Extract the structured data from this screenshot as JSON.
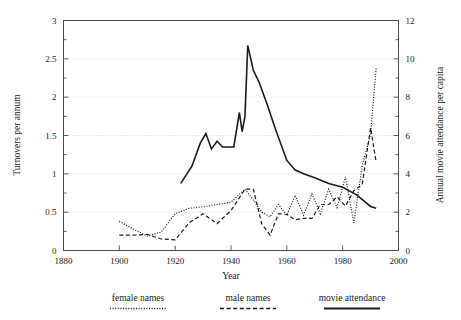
{
  "chart_data": {
    "type": "line",
    "title": "",
    "xlabel": "Year",
    "ylabel": "Turnovers per annum",
    "y2label": "Annual movie attendance per capita",
    "xlim": [
      1880,
      2000
    ],
    "ylim": [
      0,
      3
    ],
    "y2lim": [
      0,
      12
    ],
    "grid": true,
    "legend_position": "below",
    "x_ticks": [
      "1880",
      "1900",
      "1920",
      "1940",
      "1960",
      "1980",
      "2000"
    ],
    "x_tick_values": [
      1880,
      1900,
      1920,
      1940,
      1960,
      1980,
      2000
    ],
    "y_ticks": [
      "0",
      "0.5",
      "1",
      "1.5",
      "2",
      "2.5",
      "3"
    ],
    "y_tick_values": [
      0,
      0.5,
      1,
      1.5,
      2,
      2.5,
      3
    ],
    "y2_ticks": [
      "0",
      "2",
      "4",
      "6",
      "8",
      "10",
      "12"
    ],
    "y2_tick_values": [
      0,
      2,
      4,
      6,
      8,
      10,
      12
    ],
    "series": [
      {
        "name": "female names",
        "style": "dotted",
        "axis": "left",
        "color": "#1a1a1a",
        "x": [
          1900,
          1905,
          1910,
          1915,
          1920,
          1925,
          1930,
          1935,
          1940,
          1945,
          1948,
          1951,
          1954,
          1957,
          1960,
          1963,
          1966,
          1969,
          1972,
          1975,
          1978,
          1981,
          1984,
          1987,
          1990,
          1992
        ],
        "y": [
          0.38,
          0.28,
          0.19,
          0.24,
          0.48,
          0.55,
          0.57,
          0.6,
          0.63,
          0.8,
          0.66,
          0.5,
          0.44,
          0.6,
          0.46,
          0.72,
          0.46,
          0.74,
          0.48,
          0.8,
          0.56,
          0.96,
          0.36,
          1.1,
          1.52,
          2.38
        ]
      },
      {
        "name": "male names",
        "style": "dashed",
        "axis": "left",
        "color": "#1a1a1a",
        "x": [
          1900,
          1905,
          1910,
          1915,
          1920,
          1925,
          1930,
          1935,
          1940,
          1945,
          1948,
          1951,
          1954,
          1957,
          1960,
          1963,
          1966,
          1969,
          1972,
          1975,
          1978,
          1981,
          1984,
          1987,
          1990,
          1992
        ],
        "y": [
          0.2,
          0.2,
          0.21,
          0.15,
          0.14,
          0.36,
          0.48,
          0.35,
          0.52,
          0.8,
          0.8,
          0.35,
          0.2,
          0.48,
          0.47,
          0.4,
          0.42,
          0.42,
          0.6,
          0.6,
          0.7,
          0.58,
          0.78,
          0.86,
          1.6,
          1.15
        ]
      },
      {
        "name": "movie attendance",
        "style": "solid",
        "axis": "right",
        "color": "#1a1a1a",
        "x": [
          1922,
          1926,
          1929,
          1931,
          1933,
          1935,
          1937,
          1939,
          1941,
          1943,
          1944,
          1945,
          1946,
          1948,
          1950,
          1953,
          1956,
          1960,
          1963,
          1966,
          1970,
          1975,
          1980,
          1985,
          1990,
          1992
        ],
        "y_right": [
          3.5,
          4.4,
          5.6,
          6.1,
          5.3,
          5.7,
          5.4,
          5.4,
          5.4,
          7.2,
          6.2,
          7.0,
          10.7,
          9.4,
          8.8,
          7.6,
          6.3,
          4.7,
          4.2,
          4.0,
          3.8,
          3.5,
          3.3,
          2.9,
          2.3,
          2.2
        ]
      }
    ]
  },
  "legend": {
    "items": [
      {
        "label": "female names",
        "style": "dotted"
      },
      {
        "label": "male names",
        "style": "dashed"
      },
      {
        "label": "movie attendance",
        "style": "solid"
      }
    ]
  }
}
